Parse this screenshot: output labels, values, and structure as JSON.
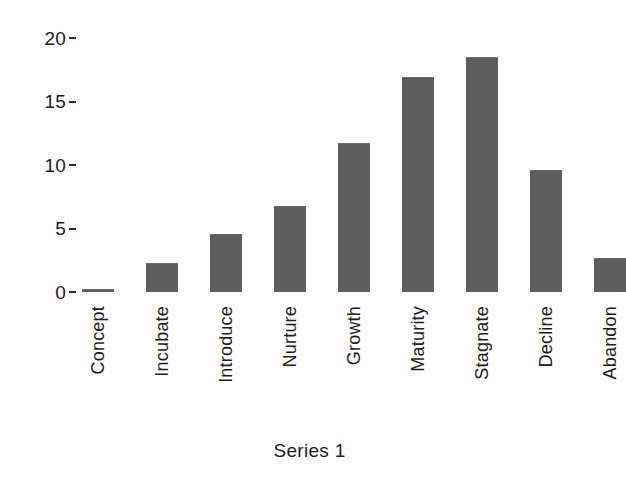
{
  "chart_data": {
    "type": "bar",
    "title": "",
    "subtitle": "",
    "xlabel": "",
    "ylabel": "",
    "categories": [
      "Concept",
      "Incubate",
      "Introduce",
      "Nurture",
      "Growth",
      "Maturity",
      "Stagnate",
      "Decline",
      "Abandon"
    ],
    "values": [
      0,
      2.3,
      4.6,
      6.8,
      11.7,
      16.9,
      18.5,
      9.6,
      2.7
    ],
    "series": [
      {
        "name": "Series 1",
        "values": [
          0,
          2.3,
          4.6,
          6.8,
          11.7,
          16.9,
          18.5,
          9.6,
          2.7
        ]
      }
    ],
    "ylim": [
      0,
      20
    ],
    "yticks": [
      0,
      5,
      10,
      15,
      20
    ],
    "ytick_labels": [
      "0",
      "5",
      "10",
      "15",
      "20"
    ],
    "grid": false,
    "legend_position": "bottom",
    "legend_entries": [
      "Series 1"
    ],
    "bar_color": "#5d5d5d",
    "background_color": "#fdfdfd",
    "text_color": "#1c1c1c",
    "xtick_rotation": -90
  },
  "caption": {
    "text": "Series 1"
  }
}
